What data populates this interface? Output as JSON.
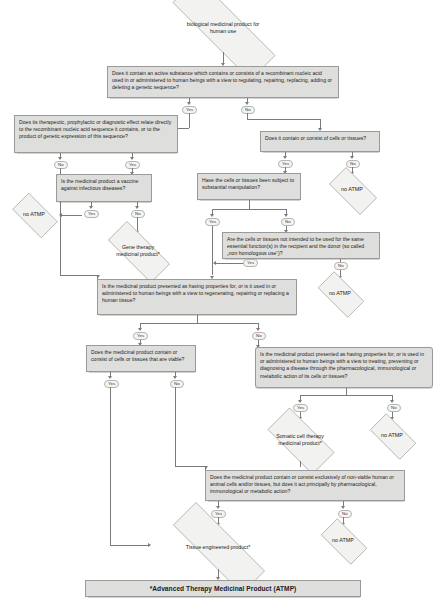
{
  "diagram": {
    "footer": "*Advanced Therapy Medicinal Product (ATMP)",
    "labels": {
      "yes": "Yes",
      "no": "No"
    }
  },
  "nodes": {
    "start": "biological medicinal product for human use",
    "q_recombinant": "Does it contain an active substance which contains or consists of a recombinant nucleic acid used in or administered to human beings with a view to regulating, repairing, replacing, adding or deleting a genetic sequence?",
    "q_effect_relates": "Does its therapeutic, prophylactic or diagnostic effect relate directly to the recombinant nucleic acid sequence it contains, or to the product of genetic expression of this sequence?",
    "q_cells_tissues": "Does it contain or consist of cells or tissues?",
    "q_vaccine": "Is the medicinal product a vaccine against infectious diseases?",
    "q_substantial_manipulation": "Have the cells or tissues been subject to substantial manipulation?",
    "q_non_homologous": "Are the cells or tissues not intended to be used for the same essential function(s) in the recipient and the donor (so called „non homologous use“)?",
    "q_regenerating": "Is the medicinal product presented as having properties for, or is it used in or administered to human beings with a view to regenerating, repairing or replacing a human tissue?",
    "q_viable": "Does the medicinal product contain or consist of cells or tissues that are viable?",
    "q_pharmacological": "Is the medicinal product presented as having properties for, or is used in or administered to human beings with a view to treating, preventing or diagnosing a disease through the pharmacological, immunological or metabolic action of its cells or tissues?",
    "q_nonviable": "Does the medicinal product contain or consist exclusively of non-viable human or animal cells and/or tissues, but does it act principally by pharmacological, immunological or metabolic action?",
    "r_gene_therapy": "Gene therapy medicinal product*",
    "r_somatic": "Somatic cell therapy medicinal product*",
    "r_tissue_engineered": "Tissue engineered product*",
    "r_no_atmp_1": "no ATMP",
    "r_no_atmp_2": "no ATMP",
    "r_no_atmp_3": "no ATMP",
    "r_no_atmp_4": "no ATMP",
    "r_no_atmp_5": "no ATMP"
  },
  "edge_labels": {
    "recombinant_yes": "Yes",
    "recombinant_no": "No",
    "effect_yes": "Yes",
    "effect_no": "No",
    "cells_yes": "Yes",
    "cells_no": "No",
    "vaccine_yes": "Yes",
    "vaccine_no": "No",
    "manip_yes": "Yes",
    "manip_no": "No",
    "nonhom_yes": "Yes",
    "nonhom_no": "No",
    "regen_yes": "Yes",
    "regen_no": "No",
    "viable_yes": "Yes",
    "viable_no": "No",
    "pharm_yes": "Yes",
    "pharm_no": "No",
    "nonviable_yes": "Yes",
    "nonviable_no": "No"
  },
  "colors": {
    "box_fill": "#dededc",
    "box_border": "#9a9a98",
    "diamond_fill": "#f2f2f0",
    "line": "#7b7b7b",
    "text": "#1b1b1b"
  }
}
